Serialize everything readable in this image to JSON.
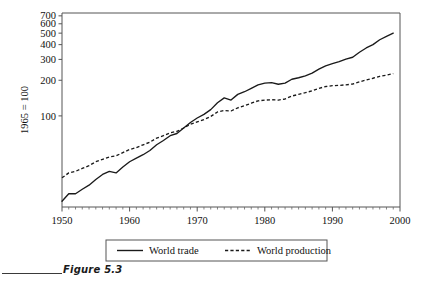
{
  "figure": {
    "caption": "Figure 5.3",
    "caption_rule": "horizontal-rule"
  },
  "chart_data": {
    "type": "line",
    "title": "",
    "subtitle": "",
    "xlabel": "",
    "ylabel": "1965 = 100",
    "scale": {
      "x": "linear",
      "y": "log"
    },
    "xlim": [
      1950,
      2000
    ],
    "ylim": [
      17,
      740
    ],
    "grid": false,
    "x_ticks_major": [
      1950,
      1960,
      1970,
      1980,
      1990,
      2000
    ],
    "x_tick_labels": [
      "1950",
      "1960",
      "1970",
      "1980",
      "1990",
      "2000"
    ],
    "x_minor_tick_interval": 1,
    "y_ticks": [
      100,
      200,
      300,
      400,
      500,
      600,
      700
    ],
    "y_tick_labels": [
      "100",
      "200",
      "300",
      "400",
      "500",
      "600",
      "700"
    ],
    "legend_position": "below-axes",
    "annotations": [],
    "x": [
      1950,
      1951,
      1952,
      1953,
      1954,
      1955,
      1956,
      1957,
      1958,
      1959,
      1960,
      1961,
      1962,
      1963,
      1964,
      1965,
      1966,
      1967,
      1968,
      1969,
      1970,
      1971,
      1972,
      1973,
      1974,
      1975,
      1976,
      1977,
      1978,
      1979,
      1980,
      1981,
      1982,
      1983,
      1984,
      1985,
      1986,
      1987,
      1988,
      1989,
      1990,
      1991,
      1992,
      1993,
      1994,
      1995,
      1996,
      1997,
      1998,
      1999
    ],
    "series": [
      {
        "name": "World trade",
        "style": "solid",
        "color": "#1a1a1a",
        "values": [
          19,
          22,
          22,
          24,
          26,
          29,
          32,
          34,
          33,
          37,
          41,
          44,
          47,
          51,
          57,
          62,
          68,
          71,
          79,
          88,
          96,
          103,
          113,
          129,
          142,
          136,
          152,
          160,
          171,
          183,
          189,
          191,
          185,
          189,
          204,
          210,
          218,
          230,
          248,
          265,
          276,
          287,
          302,
          313,
          345,
          375,
          400,
          440,
          470,
          500
        ]
      },
      {
        "name": "World production",
        "style": "dashed",
        "color": "#1a1a1a",
        "values": [
          30,
          33,
          34,
          36,
          38,
          41,
          43,
          45,
          46,
          49,
          52,
          54,
          57,
          60,
          65,
          68,
          72,
          74,
          79,
          85,
          89,
          93,
          99,
          108,
          111,
          110,
          117,
          122,
          128,
          134,
          136,
          137,
          136,
          139,
          147,
          152,
          157,
          163,
          171,
          177,
          180,
          181,
          183,
          186,
          194,
          201,
          208,
          216,
          221,
          228
        ]
      }
    ]
  },
  "legend": {
    "items": [
      {
        "label": "World  trade",
        "style": "solid"
      },
      {
        "label": "World production",
        "style": "dashed"
      }
    ]
  }
}
